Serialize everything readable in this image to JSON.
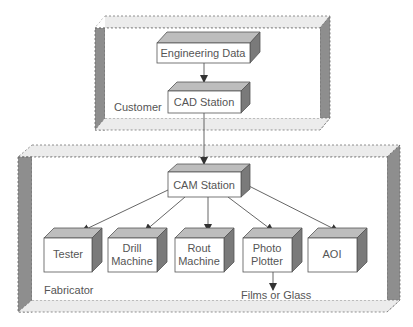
{
  "diagram": {
    "type": "flow",
    "regions": [
      {
        "id": "customer",
        "label": "Customer"
      },
      {
        "id": "fabricator",
        "label": "Fabricator"
      }
    ],
    "nodes": [
      {
        "id": "engineering_data",
        "lines": [
          "Engineering Data"
        ],
        "region": "customer"
      },
      {
        "id": "cad_station",
        "lines": [
          "CAD Station"
        ],
        "region": "customer"
      },
      {
        "id": "cam_station",
        "lines": [
          "CAM Station"
        ],
        "region": "fabricator"
      },
      {
        "id": "tester",
        "lines": [
          "Tester"
        ],
        "region": "fabricator"
      },
      {
        "id": "drill_machine",
        "lines": [
          "Drill",
          "Machine"
        ],
        "region": "fabricator"
      },
      {
        "id": "rout_machine",
        "lines": [
          "Rout",
          "Machine"
        ],
        "region": "fabricator"
      },
      {
        "id": "photo_plotter",
        "lines": [
          "Photo",
          "Plotter"
        ],
        "region": "fabricator"
      },
      {
        "id": "aoi",
        "lines": [
          "AOI"
        ],
        "region": "fabricator"
      }
    ],
    "edges": [
      [
        "engineering_data",
        "cad_station"
      ],
      [
        "cad_station",
        "cam_station"
      ],
      [
        "cam_station",
        "tester"
      ],
      [
        "cam_station",
        "drill_machine"
      ],
      [
        "cam_station",
        "rout_machine"
      ],
      [
        "cam_station",
        "photo_plotter"
      ],
      [
        "cam_station",
        "aoi"
      ],
      [
        "photo_plotter",
        "output"
      ]
    ],
    "output_label": "Films or Glass",
    "colors": {
      "box_front": "#ffffff",
      "box_top": "#bdbdbd",
      "box_side": "#7a7a7a",
      "region_side": "#8c8c8c",
      "region_band": "#e6e6e6",
      "text": "#555555",
      "arrow": "#444444"
    }
  }
}
